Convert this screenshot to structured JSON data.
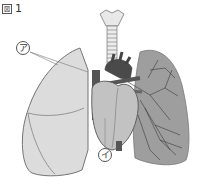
{
  "figure": {
    "label_prefix": "図",
    "label_number": "1"
  },
  "callouts": {
    "a": {
      "label": "ア",
      "target": "left lung (outer surface)"
    },
    "b": {
      "label": "イ",
      "target": "heart"
    }
  },
  "structures": [
    "trachea",
    "bronchi",
    "heart",
    "aorta",
    "pulmonary vessels",
    "right lung (as viewed left)",
    "left lung with bronchial tree (as viewed right)"
  ],
  "colors": {
    "lung_left_fill": "#d9d9d9",
    "lung_right_fill": "#9a9a9a",
    "heart_fill": "#bdbdbd",
    "vessel_dark": "#444444",
    "outline": "#666666"
  }
}
